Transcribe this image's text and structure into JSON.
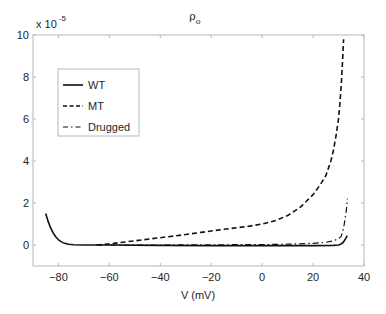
{
  "chart_data": {
    "type": "line",
    "title": "ρo",
    "title_main": "ρ",
    "title_sub": "o",
    "xlabel": "V (mV)",
    "ylabel": "",
    "y_multiplier": "x 10",
    "y_multiplier_exp": "-5",
    "xlim": [
      -90,
      40
    ],
    "ylim": [
      -1,
      10
    ],
    "xticks": [
      -80,
      -60,
      -40,
      -20,
      0,
      20,
      40
    ],
    "xtick_labels": [
      "-80",
      "-60",
      "-40",
      "-20",
      "0",
      "20",
      "40"
    ],
    "yticks": [
      0,
      2,
      4,
      6,
      8,
      10
    ],
    "ytick_labels": [
      "0",
      "2",
      "4",
      "6",
      "8",
      "10"
    ],
    "grid": false,
    "legend_position": "upper left",
    "series": [
      {
        "name": "WT",
        "style": "solid",
        "x": [
          -85,
          -84,
          -83,
          -82,
          -81,
          -80,
          -79,
          -78,
          -76,
          -74,
          -70,
          -60,
          -40,
          -20,
          0,
          20,
          28,
          30,
          31,
          31.8,
          32.5,
          33,
          33.4
        ],
        "values": [
          1.5,
          1.1,
          0.8,
          0.55,
          0.38,
          0.25,
          0.16,
          0.1,
          0.04,
          0.015,
          0.0,
          0.0,
          -0.02,
          -0.03,
          -0.03,
          -0.03,
          -0.02,
          0.0,
          0.05,
          0.12,
          0.25,
          0.35,
          0.45
        ]
      },
      {
        "name": "MT",
        "style": "dashed",
        "x": [
          -65,
          -60,
          -50,
          -40,
          -30,
          -24,
          -15,
          -5,
          0,
          5,
          10,
          15,
          20,
          23,
          25,
          27,
          28,
          29,
          30,
          30.5,
          31,
          31.5,
          32
        ],
        "values": [
          0.0,
          0.05,
          0.2,
          0.35,
          0.5,
          0.6,
          0.75,
          0.9,
          1.0,
          1.15,
          1.4,
          1.8,
          2.4,
          2.9,
          3.3,
          4.0,
          4.5,
          5.2,
          6.0,
          6.7,
          7.5,
          8.6,
          9.8
        ]
      },
      {
        "name": "Drugged",
        "style": "dashdot",
        "x": [
          -65,
          -40,
          -20,
          0,
          10,
          20,
          25,
          28,
          30,
          31,
          32,
          32.5,
          33,
          33.5
        ],
        "values": [
          0.0,
          0.0,
          0.01,
          0.02,
          0.04,
          0.08,
          0.13,
          0.2,
          0.3,
          0.4,
          0.8,
          1.2,
          1.6,
          2.2
        ]
      }
    ]
  }
}
